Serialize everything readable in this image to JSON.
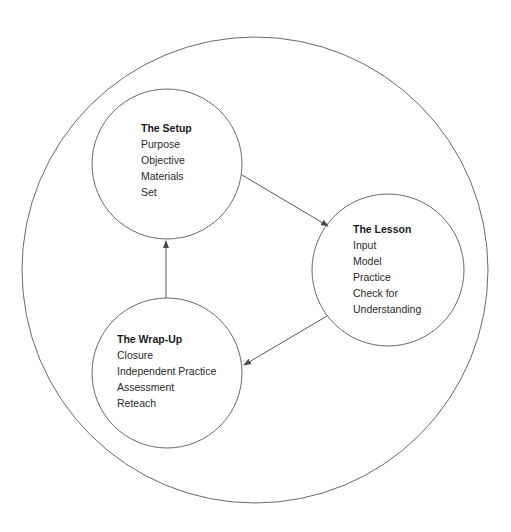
{
  "diagram": {
    "type": "cycle",
    "colors": {
      "stroke": "#6a6a6a",
      "text": "#2a2a2a",
      "background": "#ffffff"
    },
    "outer_circle": {
      "cx": 255,
      "cy": 270,
      "r": 233
    },
    "nodes": [
      {
        "id": "setup",
        "title": "The Setup",
        "items": [
          "Purpose",
          "Objective",
          "Materials",
          "Set"
        ],
        "circle": {
          "cx": 167,
          "cy": 164,
          "r": 75
        },
        "text_pos": {
          "x": 141,
          "y": 120
        }
      },
      {
        "id": "lesson",
        "title": "The Lesson",
        "items": [
          "Input",
          "Model",
          "Practice",
          "Check for",
          "Understanding"
        ],
        "circle": {
          "cx": 388,
          "cy": 270,
          "r": 76
        },
        "text_pos": {
          "x": 353,
          "y": 221
        }
      },
      {
        "id": "wrapup",
        "title": "The Wrap-Up",
        "items": [
          "Closure",
          "Independent Practice",
          "Assessment",
          "Reteach"
        ],
        "circle": {
          "cx": 167,
          "cy": 373,
          "r": 75
        },
        "text_pos": {
          "x": 117,
          "y": 331
        }
      }
    ],
    "edges": [
      {
        "from": "setup",
        "to": "lesson",
        "x1": 242,
        "y1": 175,
        "x2": 328,
        "y2": 226
      },
      {
        "from": "lesson",
        "to": "wrapup",
        "x1": 327,
        "y1": 316,
        "x2": 244,
        "y2": 365
      },
      {
        "from": "wrapup",
        "to": "setup",
        "x1": 166,
        "y1": 298,
        "x2": 166,
        "y2": 240
      }
    ]
  }
}
